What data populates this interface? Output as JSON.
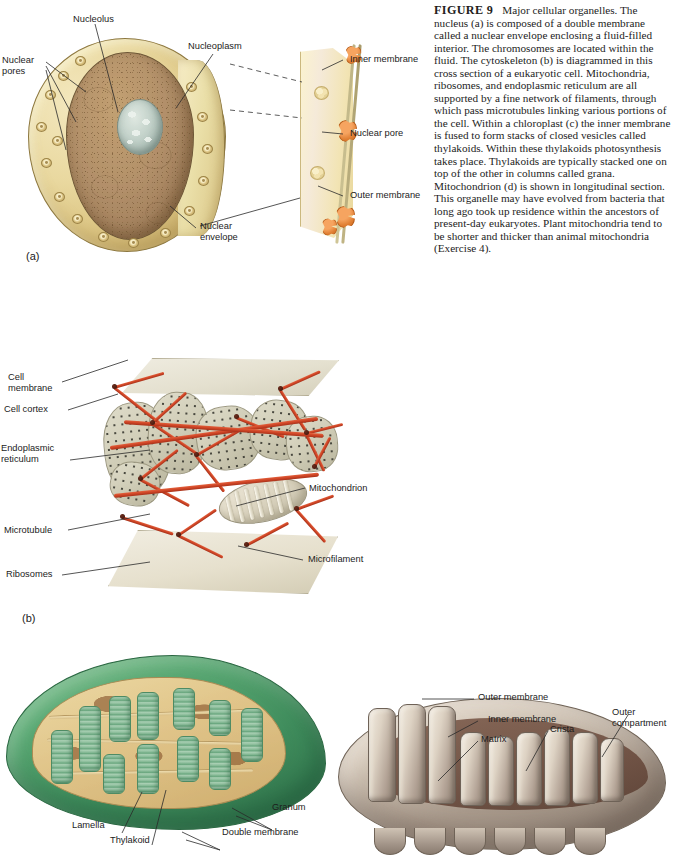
{
  "figure": {
    "number_label": "FIGURE 9",
    "caption_text": "Major cellular organelles. The nucleus (a) is composed of a double membrane called a nuclear envelope enclosing a fluid-filled interior. The chromosomes are located within the fluid. The cytoskeleton (b) is diagrammed in this cross section of a eukaryotic cell. Mitochondria, ribosomes, and endoplasmic reticulum are all supported by a fine network of filaments, through which pass microtubules linking various portions of the cell. Within a chloroplast (c) the inner membrane is fused to form stacks of closed vesicles called thylakoids. Within these thylakoids photosynthesis takes place. Thylakoids are typically stacked one on top of the other in columns called grana. Mitochondrion (d) is shown in longitudinal section. This organelle may have evolved from bacteria that long ago took up residence within the ancestors of present-day eukaryotes. Plant mitochondria tend to be shorter and thicker than animal mitochondria (Exercise 4)."
  },
  "panel_a": {
    "letter": "(a)",
    "subject": "nucleus",
    "labels": {
      "nucleolus": "Nucleolus",
      "nucleoplasm": "Nucleoplasm",
      "nuclear_pores": "Nuclear\npores",
      "nuclear_envelope": "Nuclear\nenvelope",
      "inner_membrane": "Inner membrane",
      "nuclear_pore": "Nuclear pore",
      "outer_membrane": "Outer membrane"
    }
  },
  "panel_b": {
    "letter": "(b)",
    "subject": "cytoskeleton",
    "labels": {
      "cell_membrane": "Cell\nmembrane",
      "cell_cortex": "Cell cortex",
      "endoplasmic_reticulum": "Endoplasmic\nreticulum",
      "microtubule": "Microtubule",
      "ribosomes": "Ribosomes",
      "mitochondrion": "Mitochondrion",
      "microfilament": "Microfilament"
    }
  },
  "panel_c": {
    "subject": "chloroplast",
    "labels": {
      "lamella": "Lamella",
      "thylakoid": "Thylakoid",
      "granum": "Granum",
      "double_membrane": "Double membrane"
    }
  },
  "panel_d": {
    "subject": "mitochondrion",
    "labels": {
      "outer_membrane": "Outer membrane",
      "inner_membrane": "Inner membrane",
      "matrix": "Matrix",
      "crista": "Crista",
      "outer_compartment": "Outer\ncompartment"
    }
  },
  "colors": {
    "nucleus_envelope": "#e9d89f",
    "nucleoplasm": "#b2906a",
    "nucleolus": "#c3d2ca",
    "pore_orange": "#e07f33",
    "cytoskeleton_filament": "#cf4526",
    "chloroplast_green": "#3f8c5c",
    "chloroplast_stroma": "#e0c489",
    "granum_green": "#8bbd9a",
    "mitochondrion_tan": "#cfc3b4",
    "mitochondrion_matrix": "#6b4c3e",
    "text": "#1c1c1c"
  }
}
